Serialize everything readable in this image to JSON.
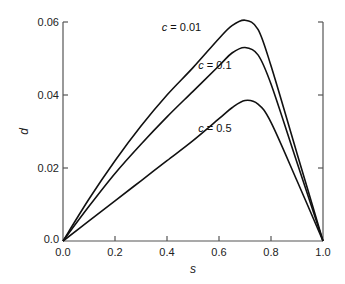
{
  "chart_data": {
    "type": "line",
    "title": "",
    "xlabel": "s",
    "ylabel": "d",
    "xlim": [
      0.0,
      1.0
    ],
    "ylim": [
      0.0,
      0.06
    ],
    "grid": false,
    "legend": "inline annotations near curves",
    "x_ticks": [
      "0.0",
      "0.2",
      "0.4",
      "0.6",
      "0.8",
      "1.0"
    ],
    "y_ticks": [
      "0.0",
      "0.02",
      "0.04",
      "0.06"
    ],
    "x": [
      0.0,
      0.1,
      0.2,
      0.3,
      0.4,
      0.5,
      0.6,
      0.65,
      0.7,
      0.75,
      0.8,
      0.9,
      1.0
    ],
    "series": [
      {
        "name": "c = 0.01",
        "values": [
          0.0,
          0.0115,
          0.022,
          0.0315,
          0.04,
          0.0475,
          0.0555,
          0.059,
          0.0605,
          0.058,
          0.048,
          0.024,
          0.0
        ]
      },
      {
        "name": "c = 0.1",
        "values": [
          0.0,
          0.0095,
          0.0185,
          0.0265,
          0.034,
          0.041,
          0.048,
          0.0515,
          0.053,
          0.051,
          0.043,
          0.0215,
          0.0
        ]
      },
      {
        "name": "c = 0.5",
        "values": [
          0.0,
          0.0055,
          0.011,
          0.0165,
          0.022,
          0.0275,
          0.0335,
          0.0365,
          0.0385,
          0.0375,
          0.0325,
          0.0165,
          0.0
        ]
      }
    ],
    "annotations": [
      {
        "text": "c = 0.01",
        "x": 0.38,
        "y": 0.0575
      },
      {
        "text": "c = 0.1",
        "x": 0.52,
        "y": 0.047
      },
      {
        "text": "c = 0.5",
        "x": 0.52,
        "y": 0.03
      }
    ]
  }
}
